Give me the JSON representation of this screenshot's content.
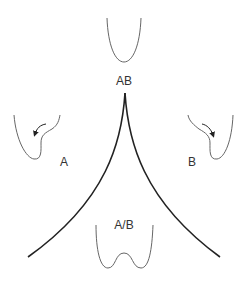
{
  "diagram": {
    "type": "cusp-catastrophe-potential-wells",
    "colors": {
      "background": "#ffffff",
      "cusp_stroke": "#222222",
      "well_stroke": "#666666",
      "label_text": "#333333"
    },
    "labels": {
      "top": "AB",
      "left": "A",
      "right": "B",
      "bottom": "A/B"
    },
    "wells": [
      {
        "id": "top",
        "shape": "single-minimum",
        "label": "AB"
      },
      {
        "id": "left",
        "shape": "asymmetric-tilted-left",
        "arrow": "down-left",
        "label": "A"
      },
      {
        "id": "right",
        "shape": "asymmetric-tilted-right",
        "arrow": "down-right",
        "label": "B"
      },
      {
        "id": "bottom",
        "shape": "double-minimum",
        "label": "A/B"
      }
    ],
    "cusp": {
      "apex": [
        125,
        93
      ],
      "left_end": [
        28,
        257
      ],
      "right_end": [
        220,
        257
      ]
    }
  }
}
